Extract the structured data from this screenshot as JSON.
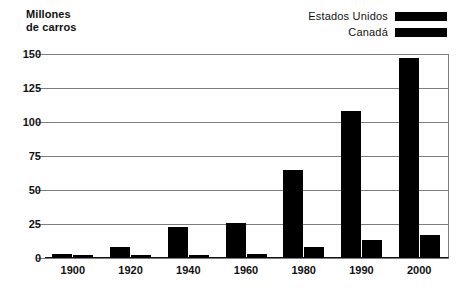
{
  "axis_title": "Millones\nde carros",
  "legend": {
    "items": [
      {
        "label": "Estados Unidos",
        "color": "#000000",
        "name": "legend-estados-unidos"
      },
      {
        "label": "Canadá",
        "color": "#000000",
        "name": "legend-canada"
      }
    ]
  },
  "chart_data": {
    "type": "bar",
    "title": "",
    "xlabel": "",
    "ylabel": "Millones de carros",
    "categories": [
      "1900",
      "1920",
      "1940",
      "1960",
      "1980",
      "1990",
      "2000"
    ],
    "series": [
      {
        "name": "Estados Unidos",
        "color": "#000000",
        "values": [
          3,
          8,
          23,
          26,
          65,
          108,
          147
        ]
      },
      {
        "name": "Canadá",
        "color": "#000000",
        "values": [
          0.5,
          2,
          2,
          3,
          8,
          13,
          17
        ]
      }
    ],
    "ylim": [
      0,
      150
    ],
    "yticks": [
      0,
      25,
      50,
      75,
      100,
      125,
      150
    ],
    "ytick_labels": [
      "0",
      "25",
      "50",
      "75",
      "100",
      "125",
      "150"
    ],
    "grid": true,
    "legend_position": "top-right"
  },
  "ticks": {
    "y": [
      "150",
      "125",
      "100",
      "75",
      "50",
      "25",
      "0"
    ],
    "x": [
      "1900",
      "1920",
      "1940",
      "1960",
      "1980",
      "1990",
      "2000"
    ]
  }
}
